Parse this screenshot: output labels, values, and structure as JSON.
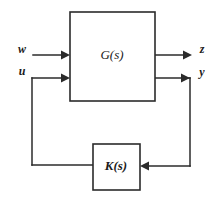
{
  "diagram": {
    "type": "control-block-diagram",
    "background_color": "#ffffff",
    "line_color": "#2b2b2b",
    "text_color": "#1a1a1a",
    "blocks": [
      {
        "id": "plant",
        "label": "G(s)",
        "x": 70,
        "y": 12,
        "width": 85,
        "height": 89,
        "label_x": 112,
        "label_y": 56,
        "bold": false
      },
      {
        "id": "controller",
        "label": "K(s)",
        "x": 93,
        "y": 144,
        "width": 47,
        "height": 46,
        "label_x": 116,
        "label_y": 167,
        "bold": true
      }
    ],
    "signals": [
      {
        "id": "exogenous-input",
        "label": "w",
        "label_x": 22,
        "label_y": 50
      },
      {
        "id": "control-input",
        "label": "u",
        "label_x": 22,
        "label_y": 72
      },
      {
        "id": "performance-output",
        "label": "z",
        "label_x": 202,
        "label_y": 50
      },
      {
        "id": "measured-output",
        "label": "y",
        "label_x": 202,
        "label_y": 73
      }
    ],
    "wires": [
      {
        "id": "wire-w-to-plant",
        "path": "M 33 55 L 66 55"
      },
      {
        "id": "wire-plant-to-z",
        "path": "M 155 55 L 188 55"
      },
      {
        "id": "wire-u-to-plant",
        "path": "M 32 78 L 66 78"
      },
      {
        "id": "wire-u-feedback-vertical",
        "path": "M 32 78 L 32 165"
      },
      {
        "id": "wire-controller-to-u",
        "path": "M 32 165 L 93 165"
      },
      {
        "id": "wire-plant-to-y",
        "path": "M 155 78 L 190 78"
      },
      {
        "id": "wire-y-feedback-vertical",
        "path": "M 190 78 L 190 166"
      },
      {
        "id": "wire-y-to-controller",
        "path": "M 190 166 L 146 166"
      }
    ],
    "arrowheads": [
      {
        "id": "arrow-w-into-plant",
        "points": "61,50.5 70,55 61,59.5"
      },
      {
        "id": "arrow-u-into-plant",
        "points": "61,73.5 70,78 61,82.5"
      },
      {
        "id": "arrow-plant-to-z",
        "points": "183,50.5 192,55 183,59.5"
      },
      {
        "id": "arrow-plant-to-y",
        "points": "181,73.5 190,78 181,82.5"
      },
      {
        "id": "arrow-y-into-controller",
        "points": "149,161.5 140,166 149,170.5"
      }
    ]
  }
}
